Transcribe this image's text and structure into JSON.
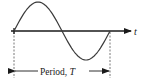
{
  "diagram": {
    "axis_label": "t",
    "period_label_prefix": "Period, ",
    "period_symbol": "T",
    "wave": {
      "function": "sine",
      "cycles": 1,
      "start_phase": "rising zero crossing"
    },
    "colors": {
      "wave": "#3a3a3a",
      "axis": "#1a1a1a",
      "dashed": "#555555"
    }
  }
}
